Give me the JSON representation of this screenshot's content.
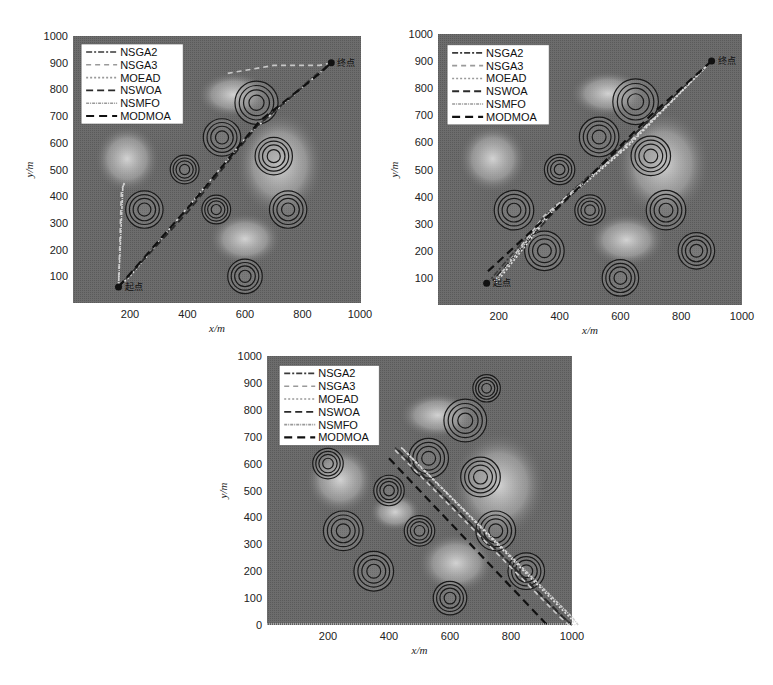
{
  "chart_data": [
    {
      "type": "line",
      "title": "",
      "xlabel": "x/m",
      "ylabel": "y/m",
      "xlim": [
        0,
        1000
      ],
      "ylim": [
        0,
        1000
      ],
      "x_ticks": [
        200,
        400,
        600,
        800,
        1000
      ],
      "y_ticks": [
        100,
        200,
        300,
        400,
        500,
        600,
        700,
        800,
        900,
        1000
      ],
      "legend_position": "upper left",
      "start_label": "起点",
      "end_label": "终点",
      "start": [
        160,
        60
      ],
      "end": [
        900,
        900
      ],
      "threats": [
        {
          "x": 640,
          "y": 750,
          "r": 75
        },
        {
          "x": 520,
          "y": 620,
          "r": 65
        },
        {
          "x": 700,
          "y": 550,
          "r": 65
        },
        {
          "x": 390,
          "y": 500,
          "r": 50
        },
        {
          "x": 250,
          "y": 350,
          "r": 65
        },
        {
          "x": 500,
          "y": 350,
          "r": 50
        },
        {
          "x": 750,
          "y": 350,
          "r": 65
        },
        {
          "x": 600,
          "y": 100,
          "r": 60
        }
      ],
      "series": [
        {
          "name": "NSGA2",
          "points": [
            [
              160,
              60
            ],
            [
              400,
              350
            ],
            [
              620,
              640
            ],
            [
              840,
              850
            ],
            [
              900,
              900
            ]
          ]
        },
        {
          "name": "NSGA3",
          "points": [
            [
              160,
              60
            ],
            [
              170,
              420
            ],
            [
              180,
              450
            ]
          ]
        },
        {
          "name": "MOEAD",
          "points": [
            [
              160,
              60
            ],
            [
              200,
              100
            ],
            [
              620,
              640
            ],
            [
              900,
              900
            ]
          ]
        },
        {
          "name": "NSWOA",
          "points": [
            [
              160,
              60
            ],
            [
              400,
              340
            ],
            [
              640,
              660
            ],
            [
              900,
              900
            ]
          ]
        },
        {
          "name": "NSMFO",
          "points": [
            [
              160,
              60
            ],
            [
              175,
              430
            ],
            [
              180,
              450
            ]
          ]
        },
        {
          "name": "MODMOA",
          "points": [
            [
              160,
              60
            ],
            [
              420,
              380
            ],
            [
              650,
              680
            ],
            [
              860,
              860
            ],
            [
              900,
              900
            ]
          ]
        }
      ],
      "extra_paths": [
        {
          "name": "NSGA3-top",
          "points": [
            [
              540,
              860
            ],
            [
              700,
              890
            ],
            [
              860,
              890
            ],
            [
              900,
              900
            ]
          ]
        }
      ]
    },
    {
      "type": "line",
      "title": "",
      "xlabel": "x/m",
      "ylabel": "y/m",
      "xlim": [
        0,
        1000
      ],
      "ylim": [
        0,
        1000
      ],
      "x_ticks": [
        200,
        400,
        600,
        800,
        1000
      ],
      "y_ticks": [
        100,
        200,
        300,
        400,
        500,
        600,
        700,
        800,
        900,
        1000
      ],
      "legend_position": "upper left",
      "start_label": "终点",
      "end_label": "起点",
      "start": [
        900,
        900
      ],
      "end": [
        160,
        80
      ],
      "threats": [
        {
          "x": 650,
          "y": 750,
          "r": 75
        },
        {
          "x": 530,
          "y": 620,
          "r": 65
        },
        {
          "x": 700,
          "y": 550,
          "r": 65
        },
        {
          "x": 400,
          "y": 500,
          "r": 50
        },
        {
          "x": 250,
          "y": 350,
          "r": 65
        },
        {
          "x": 500,
          "y": 350,
          "r": 50
        },
        {
          "x": 750,
          "y": 350,
          "r": 65
        },
        {
          "x": 350,
          "y": 200,
          "r": 65
        },
        {
          "x": 850,
          "y": 200,
          "r": 60
        },
        {
          "x": 600,
          "y": 100,
          "r": 60
        }
      ],
      "series": [
        {
          "name": "NSGA2",
          "points": [
            [
              900,
              900
            ],
            [
              600,
              580
            ],
            [
              360,
              340
            ],
            [
              170,
              90
            ]
          ]
        },
        {
          "name": "NSGA3",
          "points": [
            [
              900,
              900
            ],
            [
              600,
              570
            ],
            [
              350,
              330
            ],
            [
              180,
              80
            ]
          ]
        },
        {
          "name": "MOEAD",
          "points": [
            [
              900,
              900
            ],
            [
              620,
              580
            ],
            [
              380,
              350
            ],
            [
              190,
              80
            ]
          ]
        },
        {
          "name": "NSWOA",
          "points": [
            [
              900,
              900
            ],
            [
              590,
              570
            ],
            [
              370,
              330
            ],
            [
              180,
              90
            ]
          ]
        },
        {
          "name": "NSMFO",
          "points": [
            [
              900,
              900
            ],
            [
              610,
              575
            ],
            [
              370,
              345
            ],
            [
              185,
              85
            ]
          ]
        },
        {
          "name": "MODMOA",
          "points": [
            [
              900,
              900
            ],
            [
              700,
              700
            ],
            [
              460,
              430
            ],
            [
              160,
              120
            ]
          ]
        }
      ]
    },
    {
      "type": "line",
      "title": "",
      "xlabel": "x/m",
      "ylabel": "y/m",
      "xlim": [
        0,
        1000
      ],
      "ylim": [
        0,
        1000
      ],
      "x_ticks": [
        200,
        400,
        600,
        800,
        1000
      ],
      "y_ticks": [
        0,
        100,
        200,
        300,
        400,
        500,
        600,
        700,
        800,
        900,
        1000
      ],
      "legend_position": "upper left",
      "start_label": "",
      "end_label": "",
      "start": [
        400,
        680
      ],
      "end": [
        920,
        0
      ],
      "threats": [
        {
          "x": 720,
          "y": 880,
          "r": 45
        },
        {
          "x": 650,
          "y": 760,
          "r": 70
        },
        {
          "x": 530,
          "y": 620,
          "r": 65
        },
        {
          "x": 200,
          "y": 600,
          "r": 50
        },
        {
          "x": 700,
          "y": 550,
          "r": 65
        },
        {
          "x": 400,
          "y": 500,
          "r": 50
        },
        {
          "x": 250,
          "y": 350,
          "r": 65
        },
        {
          "x": 500,
          "y": 350,
          "r": 50
        },
        {
          "x": 750,
          "y": 350,
          "r": 65
        },
        {
          "x": 350,
          "y": 200,
          "r": 65
        },
        {
          "x": 850,
          "y": 200,
          "r": 60
        },
        {
          "x": 600,
          "y": 100,
          "r": 55
        }
      ],
      "series": [
        {
          "name": "NSGA2",
          "points": [
            [
              420,
              660
            ],
            [
              960,
              40
            ],
            [
              1000,
              0
            ]
          ]
        },
        {
          "name": "NSGA3",
          "points": [
            [
              420,
              650
            ],
            [
              960,
              30
            ],
            [
              990,
              0
            ]
          ]
        },
        {
          "name": "MOEAD",
          "points": [
            [
              440,
              660
            ],
            [
              1000,
              20
            ],
            [
              1010,
              0
            ]
          ]
        },
        {
          "name": "NSWOA",
          "points": [
            [
              430,
              650
            ],
            [
              970,
              30
            ],
            [
              1000,
              0
            ]
          ]
        },
        {
          "name": "NSMFO",
          "points": [
            [
              445,
              655
            ],
            [
              1000,
              30
            ],
            [
              1020,
              0
            ]
          ]
        },
        {
          "name": "MODMOA",
          "points": [
            [
              400,
              620
            ],
            [
              910,
              10
            ],
            [
              920,
              0
            ]
          ]
        }
      ]
    }
  ],
  "legend_entries": [
    "NSGA2",
    "NSGA3",
    "MOEAD",
    "NSWOA",
    "NSMFO",
    "MODMOA"
  ]
}
